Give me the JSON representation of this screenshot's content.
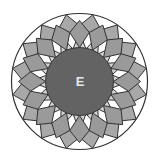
{
  "diagram": {
    "type": "geometric-rosette",
    "center_label": "E",
    "petal_count": 16,
    "geometry": {
      "cx": 79.5,
      "cy": 81.5,
      "outer_radius": 68,
      "inner_radius": 34,
      "mid_radius": 50,
      "inner_ring_outer_tip_radius": 58
    },
    "colors": {
      "background": "#ffffff",
      "outer_gap": "#ffffff",
      "outer_petal": "#a8a8a8",
      "inner_petal": "#9a9a9a",
      "inner_triangle": "#d2d2d2",
      "center_disc": "#636363",
      "stroke": "#333333",
      "label": "#e8e8e8"
    }
  }
}
